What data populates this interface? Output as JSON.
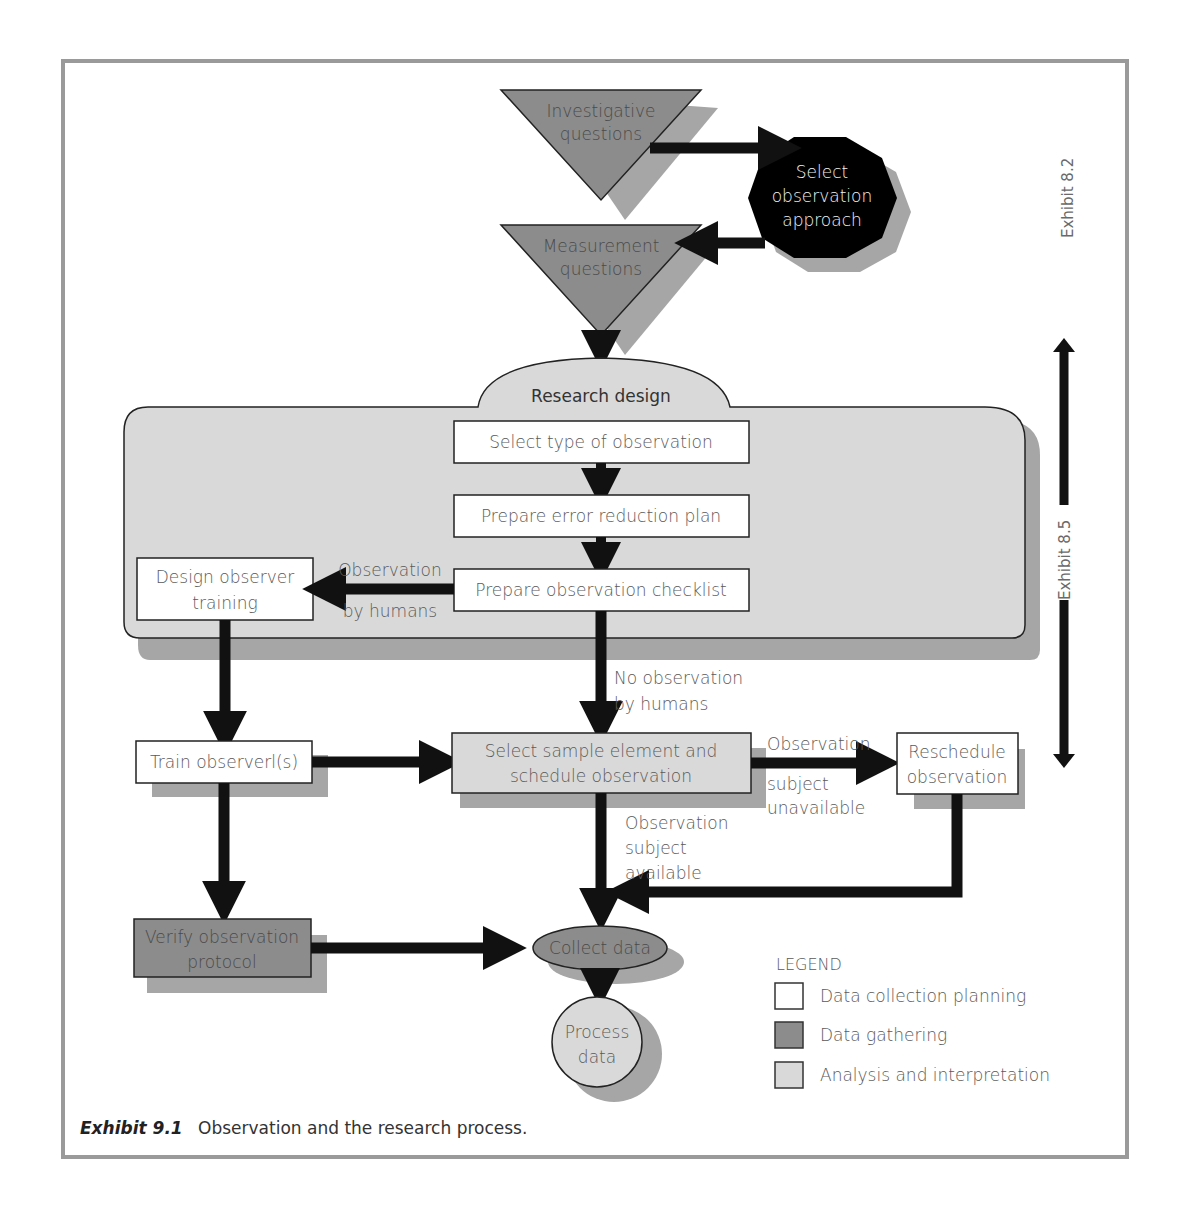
{
  "figure": {
    "caption_label": "Exhibit 9.1",
    "caption_text": "Observation and the research process."
  },
  "nodes": {
    "investigative_questions": [
      "Investigative",
      "questions"
    ],
    "select_observation_approach": [
      "Select",
      "observation",
      "approach"
    ],
    "measurement_questions": [
      "Measurement",
      "questions"
    ],
    "research_design": "Research design",
    "select_type_of_observation": "Select type of observation",
    "prepare_error_reduction_plan": "Prepare error reduction plan",
    "prepare_observation_checklist": "Prepare observation checklist",
    "design_observer_training": [
      "Design observer",
      "training"
    ],
    "train_observers": "Train observerl(s)",
    "select_sample_element": [
      "Select sample element and",
      "schedule observation"
    ],
    "reschedule_observation": [
      "Reschedule",
      "observation"
    ],
    "verify_observation_protocol": [
      "Verify observation",
      "protocol"
    ],
    "collect_data": "Collect data",
    "process_data": [
      "Process",
      "data"
    ]
  },
  "edge_labels": {
    "observation_by_humans": [
      "Observation",
      "by humans"
    ],
    "no_observation_by_humans": [
      "No observation",
      "by humans"
    ],
    "subject_unavailable": [
      "Observation",
      "subject",
      "unavailable"
    ],
    "subject_available": [
      "Observation",
      "subject",
      "available"
    ]
  },
  "side_refs": {
    "exhibit_8_2": "Exhibit 8.2",
    "exhibit_8_5": "Exhibit 8.5"
  },
  "legend": {
    "title": "LEGEND",
    "items": [
      {
        "label": "Data collection planning",
        "color": "#ffffff"
      },
      {
        "label": "Data gathering",
        "color": "#8c8c8c"
      },
      {
        "label": "Analysis and interpretation",
        "color": "#d9d9d9"
      }
    ]
  },
  "colors": {
    "frame": "#9a9a9a",
    "shadow": "#a6a6a6",
    "planning": "#ffffff",
    "gathering": "#8c8c8c",
    "analysis": "#d9d9d9",
    "arrow": "#111111"
  }
}
